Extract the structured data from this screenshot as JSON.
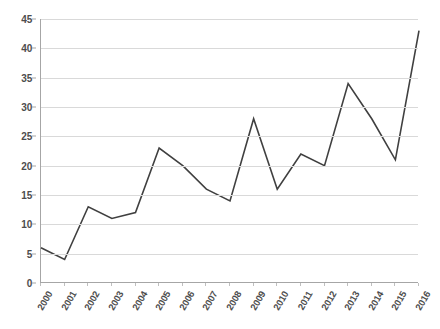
{
  "chart_data": {
    "type": "line",
    "title": "",
    "subtitle": "",
    "xlabel": "",
    "ylabel": "",
    "categories": [
      "2000",
      "2001",
      "2002",
      "2003",
      "2004",
      "2005",
      "2006",
      "2007",
      "2008",
      "2009",
      "2010",
      "2011",
      "2012",
      "2013",
      "2014",
      "2015",
      "2016"
    ],
    "series": [
      {
        "name": "",
        "values": [
          6,
          4,
          13,
          11,
          12,
          23,
          20,
          16,
          14,
          28,
          16,
          22,
          20,
          34,
          28,
          21,
          43
        ]
      }
    ],
    "values": [
      6,
      4,
      13,
      11,
      12,
      23,
      20,
      16,
      14,
      28,
      16,
      22,
      20,
      34,
      28,
      21,
      43
    ],
    "ylim": [
      0,
      45
    ],
    "ytick_labels": [
      "0",
      "5",
      "10",
      "15",
      "20",
      "25",
      "30",
      "35",
      "40",
      "45"
    ],
    "ytick_values": [
      0,
      5,
      10,
      15,
      20,
      25,
      30,
      35,
      40,
      45
    ],
    "grid": true,
    "grid_axis": "y",
    "legend": false,
    "legend_position": "none",
    "line_color": "#404040",
    "grid_color": "#d9d9d9",
    "axis_color": "#a6a6a6",
    "label_color": "#4d4d4d",
    "background_color": "#ffffff",
    "markers": false
  }
}
